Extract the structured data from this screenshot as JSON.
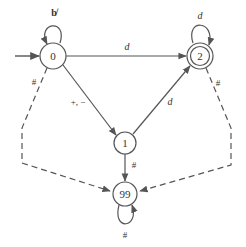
{
  "diagram": {
    "type": "finite-state-automaton",
    "colors": {
      "stroke": "#555555",
      "text": "#333333",
      "background": "#ffffff"
    },
    "states": [
      {
        "id": "0",
        "label": "0",
        "start": true,
        "accepting": false,
        "cx": 53,
        "cy": 56
      },
      {
        "id": "2",
        "label": "2",
        "start": false,
        "accepting": true,
        "cx": 200,
        "cy": 56
      },
      {
        "id": "1",
        "label": "1",
        "start": false,
        "accepting": false,
        "cx": 125,
        "cy": 143
      },
      {
        "id": "99",
        "label": "99",
        "start": false,
        "accepting": false,
        "cx": 125,
        "cy": 194
      }
    ],
    "transitions": [
      {
        "from": "0",
        "to": "0",
        "label": "b̸",
        "style": "solid"
      },
      {
        "from": "0",
        "to": "2",
        "label": "d",
        "style": "solid"
      },
      {
        "from": "0",
        "to": "1",
        "label": "+, −",
        "style": "solid"
      },
      {
        "from": "1",
        "to": "2",
        "label": "d",
        "style": "solid"
      },
      {
        "from": "2",
        "to": "2",
        "label": "d",
        "style": "solid"
      },
      {
        "from": "0",
        "to": "99",
        "label": "#",
        "style": "dashed"
      },
      {
        "from": "2",
        "to": "99",
        "label": "#",
        "style": "dashed"
      },
      {
        "from": "1",
        "to": "99",
        "label": "#",
        "style": "solid"
      },
      {
        "from": "99",
        "to": "99",
        "label": "#",
        "style": "solid"
      }
    ],
    "labels": {
      "s0": "0",
      "s1": "1",
      "s2": "2",
      "s99": "99",
      "loop0": "b̸",
      "e02": "d",
      "e01": "+, −",
      "e12": "d",
      "loop2": "d",
      "e0_99": "#",
      "e2_99": "#",
      "e1_99": "#",
      "loop99": "#"
    }
  }
}
